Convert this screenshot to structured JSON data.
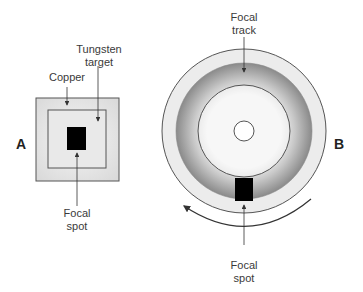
{
  "diagram": {
    "panel_a": {
      "letter": "A",
      "labels": {
        "tungsten_line1": "Tungsten",
        "tungsten_line2": "target",
        "copper": "Copper",
        "focal_line1": "Focal",
        "focal_line2": "spot"
      }
    },
    "panel_b": {
      "letter": "B",
      "labels": {
        "track_line1": "Focal",
        "track_line2": "track",
        "focal_line1": "Focal",
        "focal_line2": "spot"
      },
      "rotation_direction": "counterclockwise"
    },
    "colors": {
      "outline": "#555555",
      "copper_fill": "#e4e4e4",
      "target_fill": "#eeeeee",
      "focal_spot": "#000000",
      "track_dark": "#8a8a8a",
      "track_light": "#f2f2f2",
      "rim_fill": "#ebebeb"
    }
  }
}
